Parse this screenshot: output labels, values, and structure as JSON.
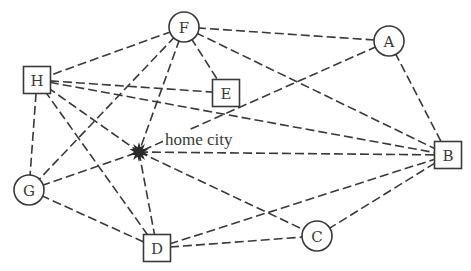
{
  "diagram": {
    "type": "graph",
    "edge_style": "dashed",
    "colors": {
      "stroke": "#3a3a3a",
      "home": "#2a2a2a",
      "background": "#ffffff"
    },
    "home": {
      "id": "home",
      "label": "home city",
      "x": 139,
      "y": 152,
      "shape": "star"
    },
    "nodes": [
      {
        "id": "F",
        "label": "F",
        "shape": "circle",
        "x": 184,
        "y": 27
      },
      {
        "id": "A",
        "label": "A",
        "shape": "circle",
        "x": 389,
        "y": 41
      },
      {
        "id": "H",
        "label": "H",
        "shape": "square",
        "x": 37,
        "y": 80
      },
      {
        "id": "E",
        "label": "E",
        "shape": "square",
        "x": 226,
        "y": 93
      },
      {
        "id": "B",
        "label": "B",
        "shape": "square",
        "x": 448,
        "y": 155
      },
      {
        "id": "G",
        "label": "G",
        "shape": "circle",
        "x": 29,
        "y": 190
      },
      {
        "id": "C",
        "label": "C",
        "shape": "circle",
        "x": 317,
        "y": 236
      },
      {
        "id": "D",
        "label": "D",
        "shape": "square",
        "x": 157,
        "y": 248
      }
    ],
    "edges": [
      [
        "F",
        "A"
      ],
      [
        "F",
        "H"
      ],
      [
        "F",
        "E"
      ],
      [
        "F",
        "B"
      ],
      [
        "F",
        "G"
      ],
      [
        "F",
        "home"
      ],
      [
        "A",
        "B"
      ],
      [
        "A",
        "home"
      ],
      [
        "H",
        "E"
      ],
      [
        "H",
        "B"
      ],
      [
        "H",
        "G"
      ],
      [
        "H",
        "home"
      ],
      [
        "H",
        "D"
      ],
      [
        "G",
        "home"
      ],
      [
        "G",
        "D"
      ],
      [
        "home",
        "B"
      ],
      [
        "home",
        "D"
      ],
      [
        "home",
        "C"
      ],
      [
        "D",
        "B"
      ],
      [
        "D",
        "C"
      ],
      [
        "C",
        "B"
      ]
    ]
  }
}
